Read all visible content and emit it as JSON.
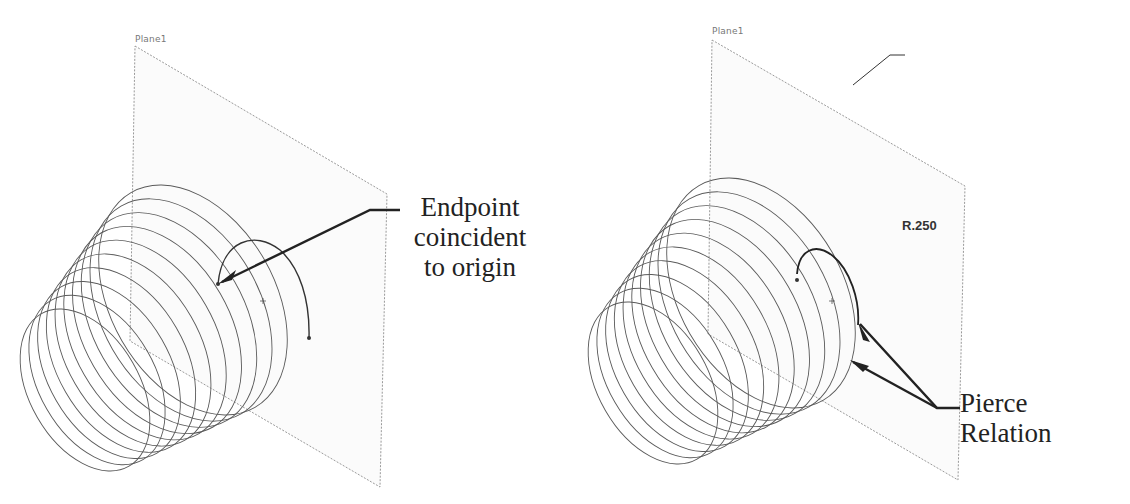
{
  "figure": {
    "left_panel": {
      "plane_label": "Plane1",
      "callout": {
        "line1": "Endpoint",
        "line2": "coincident",
        "line3": "to origin"
      }
    },
    "right_panel": {
      "plane_label": "Plane1",
      "dimension_label": "R.250",
      "callout": {
        "line1": "Pierce",
        "line2": "Relation"
      }
    },
    "colors": {
      "helix": "#555555",
      "plane_edge": "#999999",
      "arrow": "#222222",
      "text": "#222222"
    }
  }
}
